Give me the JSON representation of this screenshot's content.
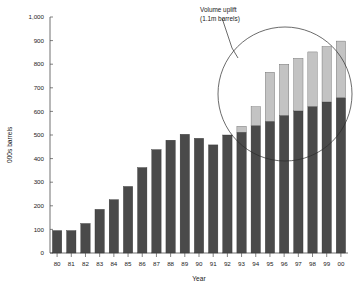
{
  "chart_data": {
    "type": "bar",
    "title": "",
    "subtitle": "",
    "xlabel": "Year",
    "ylabel": "000s barrels",
    "ylim": [
      0,
      1000
    ],
    "ytick_labels": [
      "0",
      "100",
      "200",
      "300",
      "400",
      "500",
      "600",
      "700",
      "800",
      "900",
      "1,000"
    ],
    "ytick_values": [
      0,
      100,
      200,
      300,
      400,
      500,
      600,
      700,
      800,
      900,
      1000
    ],
    "grid": false,
    "legend_position": "none",
    "stacked": true,
    "categories": [
      "80",
      "81",
      "82",
      "83",
      "84",
      "85",
      "86",
      "87",
      "88",
      "89",
      "90",
      "91",
      "92",
      "93",
      "94",
      "95",
      "96",
      "97",
      "98",
      "99",
      "00"
    ],
    "series": [
      {
        "name": "Base volume",
        "color": "#4a4a4a",
        "values": [
          95,
          95,
          125,
          185,
          226,
          282,
          362,
          438,
          478,
          503,
          486,
          458,
          500,
          512,
          540,
          558,
          583,
          602,
          621,
          640,
          658
        ]
      },
      {
        "name": "Volume uplift",
        "color": "#c3c3c3",
        "values": [
          0,
          0,
          0,
          0,
          0,
          0,
          0,
          0,
          0,
          0,
          0,
          0,
          0,
          25,
          80,
          208,
          217,
          223,
          231,
          235,
          240
        ]
      }
    ],
    "totals": [
      95,
      95,
      125,
      185,
      226,
      282,
      362,
      438,
      478,
      503,
      486,
      458,
      500,
      537,
      620,
      766,
      800,
      825,
      852,
      875,
      898
    ],
    "annotations": [
      {
        "name": "volume-uplift-callout",
        "line1": "Volume uplift",
        "line2": "(1.1m barrels)"
      }
    ]
  },
  "colors": {
    "base": "#4a4a4a",
    "uplift": "#c3c3c3",
    "axis": "#4d4d4d",
    "text": "#1a1a1a",
    "callout": "#2b2b2b",
    "background": "#ffffff"
  }
}
